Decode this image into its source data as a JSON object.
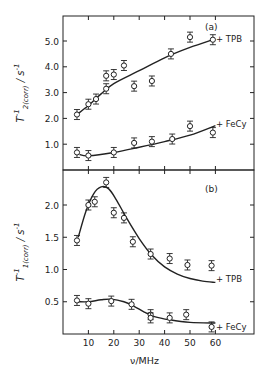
{
  "chart_data": [
    {
      "panel": "(a)",
      "type": "scatter",
      "ylabel": "T2(corr)^-1 / s^-1",
      "ylabel_main": "T",
      "ylabel_sup": "-1",
      "ylabel_sub": "2(corr)",
      "ylabel_unit": "/ s",
      "ylabel_unit_sup": "-1",
      "xlabel": "",
      "xlim": [
        0,
        75
      ],
      "ylim": [
        0,
        6.0
      ],
      "yticks": [
        1.0,
        2.0,
        3.0,
        4.0,
        5.0
      ],
      "ytick_labels": [
        "1.0",
        "2.0",
        "3.0",
        "4.0",
        "5.0"
      ],
      "xticks": [
        10,
        20,
        30,
        40,
        50,
        60
      ],
      "grid": false,
      "series": [
        {
          "name": "+ TPB",
          "points": [
            [
              5.5,
              2.15
            ],
            [
              10,
              2.55
            ],
            [
              13,
              2.75
            ],
            [
              17,
              3.15
            ],
            [
              17,
              3.65
            ],
            [
              20,
              3.7
            ],
            [
              24,
              4.05
            ],
            [
              28,
              3.25
            ],
            [
              35,
              3.45
            ],
            [
              42.5,
              4.5
            ],
            [
              50,
              5.15
            ],
            [
              59,
              5.05
            ]
          ],
          "fit": [
            [
              5.5,
              2.15
            ],
            [
              10,
              2.5
            ],
            [
              15,
              2.95
            ],
            [
              20,
              3.35
            ],
            [
              30,
              3.85
            ],
            [
              40,
              4.35
            ],
            [
              50,
              4.75
            ],
            [
              59,
              5.05
            ]
          ]
        },
        {
          "name": "+ FeCy",
          "points": [
            [
              5.5,
              0.68
            ],
            [
              10,
              0.56
            ],
            [
              20,
              0.68
            ],
            [
              28,
              1.05
            ],
            [
              35,
              1.1
            ],
            [
              43,
              1.2
            ],
            [
              50,
              1.7
            ],
            [
              59,
              1.45
            ]
          ],
          "fit": [
            [
              6.5,
              0.6
            ],
            [
              10,
              0.55
            ],
            [
              20,
              0.68
            ],
            [
              30,
              0.88
            ],
            [
              40,
              1.1
            ],
            [
              50,
              1.35
            ],
            [
              60,
              1.72
            ]
          ]
        }
      ]
    },
    {
      "panel": "(b)",
      "type": "scatter",
      "ylabel": "T1(corr)^-1 / s^-1",
      "ylabel_main": "T",
      "ylabel_sup": "-1",
      "ylabel_sub": "1(corr)",
      "ylabel_unit": "/ s",
      "ylabel_unit_sup": "-1",
      "xlabel": "ν/MHz",
      "xlim": [
        0,
        75
      ],
      "ylim": [
        0,
        2.55
      ],
      "yticks": [
        0.5,
        1.0,
        1.5,
        2.0
      ],
      "ytick_labels": [
        "0.5",
        "1.0",
        "1.5",
        "2.0"
      ],
      "xticks": [
        10,
        20,
        30,
        40,
        50,
        60
      ],
      "xtick_labels": [
        "10",
        "20",
        "30",
        "40",
        "50",
        "60"
      ],
      "grid": false,
      "series": [
        {
          "name": "+ TPB",
          "points": [
            [
              5.5,
              1.45
            ],
            [
              10,
              2.0
            ],
            [
              12.5,
              2.05
            ],
            [
              17,
              2.35
            ],
            [
              20,
              1.88
            ],
            [
              24,
              1.8
            ],
            [
              27.5,
              1.43
            ],
            [
              34.5,
              1.24
            ],
            [
              42,
              1.17
            ],
            [
              49,
              1.07
            ],
            [
              58.5,
              1.06
            ]
          ],
          "fit": [
            [
              6,
              1.5
            ],
            [
              9,
              1.9
            ],
            [
              12,
              2.17
            ],
            [
              15,
              2.28
            ],
            [
              18,
              2.25
            ],
            [
              21,
              2.08
            ],
            [
              25,
              1.8
            ],
            [
              30,
              1.48
            ],
            [
              35,
              1.22
            ],
            [
              40,
              1.04
            ],
            [
              45,
              0.93
            ],
            [
              50,
              0.86
            ],
            [
              55,
              0.82
            ],
            [
              60,
              0.8
            ]
          ]
        },
        {
          "name": "+ FeCy",
          "points": [
            [
              5.5,
              0.52
            ],
            [
              10,
              0.47
            ],
            [
              19,
              0.51
            ],
            [
              27,
              0.46
            ],
            [
              34.5,
              0.3
            ],
            [
              34.5,
              0.25
            ],
            [
              42,
              0.25
            ],
            [
              48.5,
              0.3
            ],
            [
              58.5,
              0.11
            ]
          ],
          "fit": [
            [
              6,
              0.5
            ],
            [
              10,
              0.5
            ],
            [
              15,
              0.53
            ],
            [
              19,
              0.54
            ],
            [
              24,
              0.5
            ],
            [
              28,
              0.43
            ],
            [
              32,
              0.34
            ],
            [
              36,
              0.27
            ],
            [
              42,
              0.22
            ],
            [
              50,
              0.18
            ],
            [
              60,
              0.17
            ]
          ]
        }
      ]
    }
  ],
  "labels": {
    "panel_a": "(a)",
    "panel_b": "(b)",
    "xlabel": "ν/MHz",
    "tpb": "+ TPB",
    "fecy": "+ FeCy"
  }
}
